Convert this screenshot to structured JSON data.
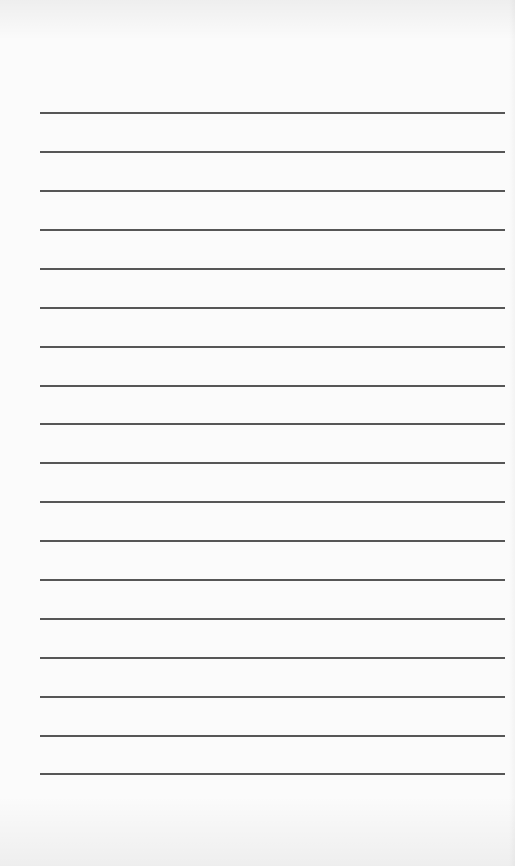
{
  "page": {
    "type": "lined-notepad-sheet",
    "background_color": "#fbfbfb",
    "line_color": "#3f3f3f",
    "line_count": 18,
    "line_left_px": 40,
    "line_right_px": 505,
    "first_line_y_px": 113,
    "line_spacing_px": 38.9,
    "lines": [
      {
        "index": 1,
        "y": 113,
        "text": ""
      },
      {
        "index": 2,
        "y": 152,
        "text": ""
      },
      {
        "index": 3,
        "y": 191,
        "text": ""
      },
      {
        "index": 4,
        "y": 230,
        "text": ""
      },
      {
        "index": 5,
        "y": 269,
        "text": ""
      },
      {
        "index": 6,
        "y": 308,
        "text": ""
      },
      {
        "index": 7,
        "y": 347,
        "text": ""
      },
      {
        "index": 8,
        "y": 386,
        "text": ""
      },
      {
        "index": 9,
        "y": 424,
        "text": ""
      },
      {
        "index": 10,
        "y": 463,
        "text": ""
      },
      {
        "index": 11,
        "y": 502,
        "text": ""
      },
      {
        "index": 12,
        "y": 541,
        "text": ""
      },
      {
        "index": 13,
        "y": 580,
        "text": ""
      },
      {
        "index": 14,
        "y": 619,
        "text": ""
      },
      {
        "index": 15,
        "y": 658,
        "text": ""
      },
      {
        "index": 16,
        "y": 697,
        "text": ""
      },
      {
        "index": 17,
        "y": 736,
        "text": ""
      },
      {
        "index": 18,
        "y": 774,
        "text": ""
      }
    ]
  }
}
